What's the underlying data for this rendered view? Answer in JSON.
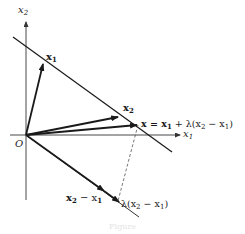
{
  "diagram": {
    "axes": {
      "x1_label": "x",
      "x1_sub": "1",
      "x2_label": "x",
      "x2_sub": "2",
      "origin_label": "O"
    },
    "vectors": {
      "x1": {
        "label": "x",
        "sub": "1"
      },
      "x2": {
        "label": "x",
        "sub": "2"
      },
      "x": {
        "label_prefix": "x = x",
        "sub1": "1",
        "mid": " + λ(x",
        "sub2": "2",
        "mid2": " − x",
        "sub3": "1",
        "suffix": ")"
      },
      "diff": {
        "label_a": "x",
        "sub_a": "2",
        "mid": " − x",
        "sub_b": "1"
      },
      "scaled": {
        "label_a": "λ(x",
        "sub_a": "2",
        "mid": " − x",
        "sub_b": "1",
        "suffix": ")"
      }
    },
    "caption": "Figure",
    "colors": {
      "ink": "#1a1a1a",
      "axis": "#333333",
      "dashed": "#555555"
    }
  }
}
